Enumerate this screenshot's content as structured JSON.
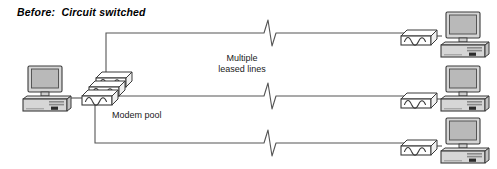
{
  "title": "Before:  Circuit switched",
  "labels": {
    "multiple": "Multiple",
    "leased_lines": "leased lines",
    "modem_pool": "Modem pool"
  },
  "colors": {
    "line": "#555555",
    "outline": "#3a3a3a",
    "screen_fill": "#b9b9b9",
    "case_fill": "#d6d6d6",
    "modem_fill": "#ffffff",
    "text": "#000000",
    "background": "#ffffff"
  },
  "diagram": {
    "type": "network-topology",
    "left_workstation": {
      "name": "client-workstation",
      "icon": "desktop-computer-icon",
      "x": 22,
      "y": 66
    },
    "modem_pool": {
      "name": "modem-pool-stack",
      "icon": "modem-icon",
      "count": 3,
      "x": 82,
      "y": 72
    },
    "leased_lines": [
      {
        "name": "leased-line-1",
        "break_x": 270,
        "y": 33
      },
      {
        "name": "leased-line-2",
        "break_x": 270,
        "y": 96
      },
      {
        "name": "leased-line-3",
        "break_x": 270,
        "y": 143
      }
    ],
    "remote_sites": [
      {
        "name": "remote-site-1",
        "modem_icon": "modem-icon",
        "computer_icon": "desktop-computer-icon",
        "y": 12
      },
      {
        "name": "remote-site-2",
        "modem_icon": "modem-icon",
        "computer_icon": "desktop-computer-icon",
        "y": 66
      },
      {
        "name": "remote-site-3",
        "modem_icon": "modem-icon",
        "computer_icon": "desktop-computer-icon",
        "y": 118
      }
    ]
  }
}
